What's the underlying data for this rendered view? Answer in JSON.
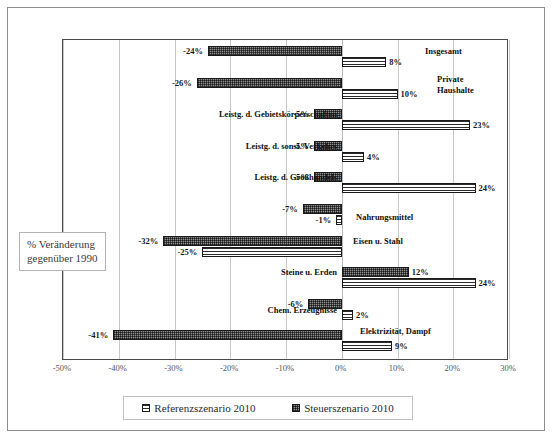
{
  "chart_data": {
    "type": "bar",
    "orientation": "horizontal",
    "title": "",
    "xlabel": "",
    "ylabel": "",
    "xlim": [
      -50,
      30
    ],
    "xticks": [
      -50,
      -40,
      -30,
      -20,
      -10,
      0,
      10,
      20,
      30
    ],
    "xtick_labels": [
      "-50%",
      "-40%",
      "-30%",
      "-20%",
      "-10%",
      "0%",
      "10%",
      "20%",
      "30%"
    ],
    "grid": true,
    "legend_position": "bottom",
    "annotation": "% Veränderung gegenüber 1990",
    "annotation_line1": "% Veränderung",
    "annotation_line2": "gegenüber 1990",
    "categories": [
      "Insgesamt",
      "Private Haushalte",
      "Leistg. d. Gebietskörperschaften",
      "Leistg. d. sonst. Verkehrs",
      "Leistg. d. Großhandels",
      "Nahrungsmittel",
      "Eisen u. Stahl",
      "Steine u. Erden",
      "Chem. Erzeugnisse",
      "Elektrizität, Dampf"
    ],
    "series": [
      {
        "name": "Steuerszenario 2010",
        "pattern": "checkered-dark",
        "values": [
          -24,
          -26,
          -5,
          -5,
          -5,
          -7,
          -32,
          12,
          -6,
          -41
        ],
        "labels": [
          "-24%",
          "-26%",
          "-5%",
          "-5%",
          "-5%",
          "-7%",
          "-32%",
          "12%",
          "-6%",
          "-41%"
        ]
      },
      {
        "name": "Referenzszenario 2010",
        "pattern": "horizontal-stripes",
        "values": [
          8,
          10,
          23,
          4,
          24,
          -1,
          -25,
          24,
          2,
          9
        ],
        "labels": [
          "8%",
          "10%",
          "23%",
          "4%",
          "24%",
          "-1%",
          "-25%",
          "24%",
          "2%",
          "9%"
        ]
      }
    ]
  },
  "legend": {
    "items": [
      {
        "label": "Referenzszenario 2010",
        "swatch": "referenz"
      },
      {
        "label": "Steuerszenario 2010",
        "swatch": "steuer"
      }
    ]
  }
}
